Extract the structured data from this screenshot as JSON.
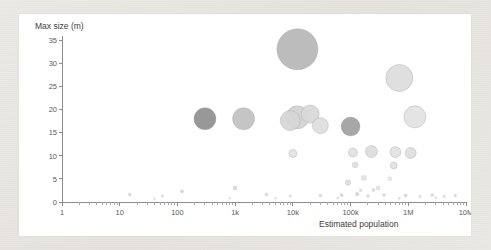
{
  "chart_data": {
    "type": "scatter",
    "title": "",
    "xlabel": "Estimated population",
    "ylabel": "Max size (m)",
    "xscale": "log",
    "yscale": "linear",
    "xlim": [
      1,
      10000000
    ],
    "ylim": [
      0,
      35
    ],
    "grid": false,
    "legend": null,
    "x_tick_labels": [
      "1",
      "10",
      "100",
      "1k",
      "10k",
      "100k",
      "1M",
      "10M"
    ],
    "x_tick_values": [
      1,
      10,
      100,
      1000,
      10000,
      100000,
      1000000,
      10000000
    ],
    "y_tick_labels": [
      "0",
      "5",
      "10",
      "15",
      "20",
      "25",
      "30",
      "35"
    ],
    "y_tick_values": [
      0,
      5,
      10,
      15,
      20,
      25,
      30,
      35
    ],
    "size_encodes": "bubble area",
    "points": [
      {
        "x": 12000,
        "y": 33.0,
        "r": 20.5,
        "fill": "#b6b6b6"
      },
      {
        "x": 700000,
        "y": 26.8,
        "r": 13.5,
        "fill": "#dcdcdc"
      },
      {
        "x": 300,
        "y": 18.0,
        "r": 11.0,
        "fill": "#8f8f8f"
      },
      {
        "x": 1400,
        "y": 18.0,
        "r": 11.0,
        "fill": "#c0c0c0"
      },
      {
        "x": 12000,
        "y": 18.3,
        "r": 11.5,
        "fill": "#d3d3d3"
      },
      {
        "x": 20000,
        "y": 19.0,
        "r": 9.0,
        "fill": "#d8d8d8"
      },
      {
        "x": 9000,
        "y": 17.6,
        "r": 10.0,
        "fill": "#d6d6d6"
      },
      {
        "x": 30000,
        "y": 16.5,
        "r": 8.0,
        "fill": "#dddddd"
      },
      {
        "x": 100000,
        "y": 16.3,
        "r": 9.5,
        "fill": "#9f9f9f"
      },
      {
        "x": 1300000,
        "y": 18.4,
        "r": 11.0,
        "fill": "#e2e2e2"
      },
      {
        "x": 10000,
        "y": 10.5,
        "r": 4.0,
        "fill": "#e3e3e3"
      },
      {
        "x": 110000,
        "y": 10.7,
        "r": 4.5,
        "fill": "#e0e0e0"
      },
      {
        "x": 230000,
        "y": 10.9,
        "r": 6.0,
        "fill": "#dcdcdc"
      },
      {
        "x": 600000,
        "y": 10.8,
        "r": 5.5,
        "fill": "#e2e2e2"
      },
      {
        "x": 1100000,
        "y": 10.6,
        "r": 5.5,
        "fill": "#dedede"
      },
      {
        "x": 120000,
        "y": 8.0,
        "r": 3.0,
        "fill": "#e0e0e0"
      },
      {
        "x": 560000,
        "y": 7.9,
        "r": 3.5,
        "fill": "#e2e2e2"
      },
      {
        "x": 170000,
        "y": 5.2,
        "r": 2.5,
        "fill": "#e5e5e5"
      },
      {
        "x": 480000,
        "y": 5.0,
        "r": 2.0,
        "fill": "#e6e6e6"
      },
      {
        "x": 90000,
        "y": 4.2,
        "r": 2.8,
        "fill": "#dcdcdc"
      },
      {
        "x": 300000,
        "y": 3.0,
        "r": 2.0,
        "fill": "#e4e4e4"
      },
      {
        "x": 1000,
        "y": 3.0,
        "r": 2.0,
        "fill": "#d9d9d9"
      },
      {
        "x": 120,
        "y": 2.3,
        "r": 1.6,
        "fill": "#d8d8d8"
      },
      {
        "x": 15,
        "y": 1.6,
        "r": 1.4,
        "fill": "#d5d5d5"
      },
      {
        "x": 55,
        "y": 1.3,
        "r": 1.2,
        "fill": "#e0e0e0"
      },
      {
        "x": 3500,
        "y": 1.6,
        "r": 1.5,
        "fill": "#dcdcdc"
      },
      {
        "x": 9000,
        "y": 1.3,
        "r": 1.2,
        "fill": "#e2e2e2"
      },
      {
        "x": 30000,
        "y": 1.4,
        "r": 1.5,
        "fill": "#dedede"
      },
      {
        "x": 70000,
        "y": 1.5,
        "r": 1.6,
        "fill": "#dadada"
      },
      {
        "x": 130000,
        "y": 1.7,
        "r": 1.8,
        "fill": "#d6d6d6"
      },
      {
        "x": 200000,
        "y": 1.3,
        "r": 1.4,
        "fill": "#e0e0e0"
      },
      {
        "x": 380000,
        "y": 1.5,
        "r": 1.5,
        "fill": "#dddddd"
      },
      {
        "x": 900000,
        "y": 1.4,
        "r": 1.6,
        "fill": "#dbdbdb"
      },
      {
        "x": 1600000,
        "y": 1.2,
        "r": 1.3,
        "fill": "#e2e2e2"
      },
      {
        "x": 2600000,
        "y": 1.5,
        "r": 1.5,
        "fill": "#dddddd"
      },
      {
        "x": 4200000,
        "y": 1.2,
        "r": 1.3,
        "fill": "#e1e1e1"
      },
      {
        "x": 6500000,
        "y": 1.4,
        "r": 1.4,
        "fill": "#dedede"
      },
      {
        "x": 250000,
        "y": 2.6,
        "r": 1.5,
        "fill": "#dcdcdc"
      },
      {
        "x": 150000,
        "y": 2.5,
        "r": 1.4,
        "fill": "#dfdfdf"
      },
      {
        "x": 800,
        "y": 0.8,
        "r": 1.0,
        "fill": "#e4e4e4"
      },
      {
        "x": 40,
        "y": 0.7,
        "r": 0.9,
        "fill": "#e6e6e6"
      },
      {
        "x": 5000,
        "y": 0.8,
        "r": 1.0,
        "fill": "#e5e5e5"
      },
      {
        "x": 60000,
        "y": 0.9,
        "r": 1.0,
        "fill": "#e3e3e3"
      },
      {
        "x": 700000,
        "y": 0.8,
        "r": 1.0,
        "fill": "#e4e4e4"
      },
      {
        "x": 3000000,
        "y": 0.9,
        "r": 1.0,
        "fill": "#e3e3e3"
      }
    ]
  }
}
